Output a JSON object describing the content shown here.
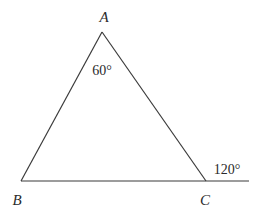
{
  "diagram": {
    "type": "geometry-triangle",
    "vertices": [
      {
        "id": "A",
        "label": "A",
        "x": 102,
        "y": 32
      },
      {
        "id": "B",
        "label": "B",
        "x": 21,
        "y": 181
      },
      {
        "id": "C",
        "label": "C",
        "x": 206,
        "y": 181
      }
    ],
    "extension_end": {
      "x": 249,
      "y": 181
    },
    "angles": {
      "interior_A": "60°",
      "exterior_C": "120°"
    },
    "colors": {
      "stroke": "#3a3a3a",
      "text": "#2a2a2a",
      "background": "#ffffff"
    }
  }
}
